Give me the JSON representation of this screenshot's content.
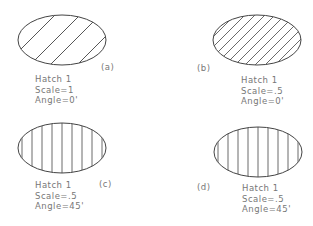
{
  "figures": [
    {
      "id": "a",
      "tag": "(a)",
      "pattern": "Hatch  1",
      "scale": "Scale=1",
      "angle": "Angle=0'"
    },
    {
      "id": "b",
      "tag": "(b)",
      "pattern": "Hatch  1",
      "scale": "Scale=.5",
      "angle": "Angle=0'"
    },
    {
      "id": "c",
      "tag": "(c)",
      "pattern": "Hatch  1",
      "scale": "Scale=.5",
      "angle": "Angle=45'"
    },
    {
      "id": "d",
      "tag": "(d)",
      "pattern": "Hatch  1",
      "scale": "Scale=.5",
      "angle": "Angle=45'"
    }
  ]
}
